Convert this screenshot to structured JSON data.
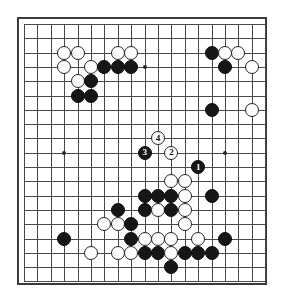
{
  "figure": {
    "kind": "go-board-diagram",
    "board_size": 19,
    "caption": ""
  },
  "colors": {
    "board_background": "#ffffff",
    "grid_line": "#4a4a4a",
    "border": "#3a3a3a",
    "black_stone": "#161616",
    "white_stone": "#fdfdfd",
    "white_stone_edge": "#242424",
    "hoshi": "#2b2b2b",
    "black_label_text": "#ffffff",
    "white_label_text": "#111111"
  },
  "geometry": {
    "board_left": 17,
    "board_top": 17,
    "board_width": 250,
    "board_height": 268,
    "grid_origin_x": 5,
    "grid_origin_y": 5,
    "cell_width": 13.4,
    "cell_height": 14.3,
    "stone_diameter": 14
  },
  "hoshi_points": [
    {
      "col": 4,
      "row": 4
    },
    {
      "col": 10,
      "row": 4
    },
    {
      "col": 16,
      "row": 4
    },
    {
      "col": 4,
      "row": 10
    },
    {
      "col": 10,
      "row": 10
    },
    {
      "col": 16,
      "row": 10
    },
    {
      "col": 4,
      "row": 16
    },
    {
      "col": 10,
      "row": 16
    },
    {
      "col": 16,
      "row": 16
    }
  ],
  "stones": [
    {
      "col": 4,
      "row": 3,
      "color": "white",
      "label": ""
    },
    {
      "col": 5,
      "row": 3,
      "color": "white",
      "label": ""
    },
    {
      "col": 8,
      "row": 3,
      "color": "white",
      "label": ""
    },
    {
      "col": 9,
      "row": 3,
      "color": "white",
      "label": ""
    },
    {
      "col": 15,
      "row": 3,
      "color": "black",
      "label": ""
    },
    {
      "col": 16,
      "row": 3,
      "color": "white",
      "label": ""
    },
    {
      "col": 17,
      "row": 3,
      "color": "white",
      "label": ""
    },
    {
      "col": 4,
      "row": 4,
      "color": "white",
      "label": ""
    },
    {
      "col": 6,
      "row": 4,
      "color": "white",
      "label": ""
    },
    {
      "col": 7,
      "row": 4,
      "color": "black",
      "label": ""
    },
    {
      "col": 8,
      "row": 4,
      "color": "black",
      "label": ""
    },
    {
      "col": 9,
      "row": 4,
      "color": "black",
      "label": ""
    },
    {
      "col": 16,
      "row": 4,
      "color": "black",
      "label": ""
    },
    {
      "col": 18,
      "row": 4,
      "color": "white",
      "label": ""
    },
    {
      "col": 5,
      "row": 5,
      "color": "white",
      "label": ""
    },
    {
      "col": 6,
      "row": 5,
      "color": "black",
      "label": ""
    },
    {
      "col": 5,
      "row": 6,
      "color": "black",
      "label": ""
    },
    {
      "col": 6,
      "row": 6,
      "color": "black",
      "label": ""
    },
    {
      "col": 15,
      "row": 7,
      "color": "black",
      "label": ""
    },
    {
      "col": 18,
      "row": 7,
      "color": "white",
      "label": ""
    },
    {
      "col": 11,
      "row": 9,
      "color": "white",
      "label": "4"
    },
    {
      "col": 10,
      "row": 10,
      "color": "black",
      "label": "3"
    },
    {
      "col": 12,
      "row": 10,
      "color": "white",
      "label": "2"
    },
    {
      "col": 14,
      "row": 11,
      "color": "black",
      "label": "1"
    },
    {
      "col": 12,
      "row": 12,
      "color": "white",
      "label": ""
    },
    {
      "col": 13,
      "row": 12,
      "color": "white",
      "label": ""
    },
    {
      "col": 10,
      "row": 13,
      "color": "black",
      "label": ""
    },
    {
      "col": 11,
      "row": 13,
      "color": "black",
      "label": ""
    },
    {
      "col": 12,
      "row": 13,
      "color": "black",
      "label": ""
    },
    {
      "col": 13,
      "row": 13,
      "color": "white",
      "label": ""
    },
    {
      "col": 15,
      "row": 13,
      "color": "black",
      "label": ""
    },
    {
      "col": 8,
      "row": 14,
      "color": "black",
      "label": ""
    },
    {
      "col": 10,
      "row": 14,
      "color": "black",
      "label": ""
    },
    {
      "col": 11,
      "row": 14,
      "color": "white",
      "label": ""
    },
    {
      "col": 12,
      "row": 14,
      "color": "black",
      "label": ""
    },
    {
      "col": 13,
      "row": 14,
      "color": "white",
      "label": ""
    },
    {
      "col": 7,
      "row": 15,
      "color": "white",
      "label": ""
    },
    {
      "col": 8,
      "row": 15,
      "color": "white",
      "label": ""
    },
    {
      "col": 9,
      "row": 15,
      "color": "black",
      "label": ""
    },
    {
      "col": 13,
      "row": 15,
      "color": "white",
      "label": ""
    },
    {
      "col": 4,
      "row": 16,
      "color": "black",
      "label": ""
    },
    {
      "col": 9,
      "row": 16,
      "color": "black",
      "label": ""
    },
    {
      "col": 10,
      "row": 16,
      "color": "white",
      "label": ""
    },
    {
      "col": 11,
      "row": 16,
      "color": "white",
      "label": ""
    },
    {
      "col": 12,
      "row": 16,
      "color": "white",
      "label": ""
    },
    {
      "col": 14,
      "row": 16,
      "color": "white",
      "label": ""
    },
    {
      "col": 16,
      "row": 16,
      "color": "black",
      "label": ""
    },
    {
      "col": 6,
      "row": 17,
      "color": "white",
      "label": ""
    },
    {
      "col": 8,
      "row": 17,
      "color": "white",
      "label": ""
    },
    {
      "col": 9,
      "row": 17,
      "color": "white",
      "label": ""
    },
    {
      "col": 10,
      "row": 17,
      "color": "black",
      "label": ""
    },
    {
      "col": 11,
      "row": 17,
      "color": "black",
      "label": ""
    },
    {
      "col": 12,
      "row": 17,
      "color": "white",
      "label": ""
    },
    {
      "col": 13,
      "row": 17,
      "color": "black",
      "label": ""
    },
    {
      "col": 14,
      "row": 17,
      "color": "black",
      "label": ""
    },
    {
      "col": 15,
      "row": 17,
      "color": "black",
      "label": ""
    },
    {
      "col": 12,
      "row": 18,
      "color": "black",
      "label": ""
    }
  ],
  "move_sequence": [
    {
      "number": "1",
      "color": "black",
      "col": 14,
      "row": 11
    },
    {
      "number": "2",
      "color": "white",
      "col": 12,
      "row": 10
    },
    {
      "number": "3",
      "color": "black",
      "col": 10,
      "row": 10
    },
    {
      "number": "4",
      "color": "white",
      "col": 11,
      "row": 9
    }
  ]
}
